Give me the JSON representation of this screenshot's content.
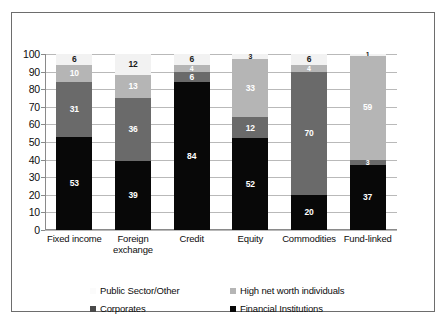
{
  "chart_data": {
    "type": "bar",
    "subtype": "stacked-column-100",
    "title": "",
    "xlabel": "",
    "ylabel": "",
    "ylim": [
      0,
      100
    ],
    "yticks": [
      0,
      10,
      20,
      30,
      40,
      50,
      60,
      70,
      80,
      90,
      100
    ],
    "grid": true,
    "legend_position": "bottom",
    "categories": [
      "Fixed income",
      "Foreign exchange",
      "Credit",
      "Equity",
      "Commodities",
      "Fund-linked"
    ],
    "series": [
      {
        "name": "Financial Institutions",
        "color": "#080808",
        "values": [
          53,
          39,
          84,
          52,
          20,
          37
        ]
      },
      {
        "name": "Corporates",
        "color": "#6a6a6a",
        "values": [
          31,
          36,
          6,
          12,
          70,
          3
        ]
      },
      {
        "name": "High net worth individuals",
        "color": "#b5b5b5",
        "values": [
          10,
          13,
          4,
          33,
          4,
          59
        ]
      },
      {
        "name": "Public Sector/Other",
        "color": "#f2f2f2",
        "values": [
          6,
          12,
          6,
          3,
          6,
          1
        ]
      }
    ]
  },
  "legend": {
    "items": [
      {
        "label": "Public Sector/Other",
        "swatch": "sw-pub"
      },
      {
        "label": "High net worth individuals",
        "swatch": "sw-hnw"
      },
      {
        "label": "Corporates",
        "swatch": "sw-corp"
      },
      {
        "label": "Financial Institutions",
        "swatch": "sw-fin"
      }
    ]
  }
}
